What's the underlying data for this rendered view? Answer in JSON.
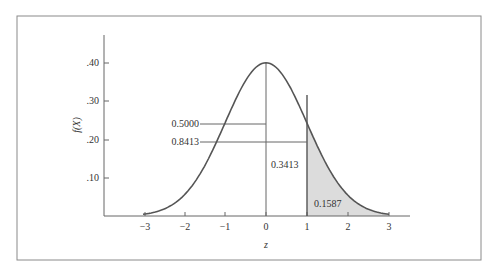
{
  "chart_data": {
    "type": "area",
    "title": "",
    "xlabel": "z",
    "ylabel": "f(X)",
    "x_ticks": [
      "-3",
      "-2",
      "-1",
      "0",
      "1",
      "2",
      "3"
    ],
    "y_ticks": [
      ".10",
      ".20",
      ".30",
      ".40"
    ],
    "xlim": [
      -4,
      3.5
    ],
    "ylim": [
      0,
      0.47
    ],
    "grid": false,
    "series": [
      {
        "name": "Standard normal density",
        "function": "f(z) = exp(-z^2/2)/sqrt(2*pi)",
        "x": [
          -3,
          -2.5,
          -2,
          -1.5,
          -1,
          -0.5,
          0,
          0.5,
          1,
          1.5,
          2,
          2.5,
          3
        ],
        "values": [
          0.0044,
          0.0175,
          0.054,
          0.1295,
          0.242,
          0.3521,
          0.3989,
          0.3521,
          0.242,
          0.1295,
          0.054,
          0.0175,
          0.0044
        ]
      }
    ],
    "shaded_region": {
      "from": 1,
      "to": 3,
      "area": "0.1587"
    },
    "annotations": [
      {
        "text": "0.5000",
        "target": "area left of z=0"
      },
      {
        "text": "0.8413",
        "target": "area left of z=1"
      },
      {
        "text": "0.3413",
        "target": "area between z=0 and z=1"
      },
      {
        "text": "0.1587",
        "target": "area right of z=1 (shaded)"
      }
    ]
  },
  "labels": {
    "ylabel": "f(X)",
    "xlabel": "z",
    "ann_half": "0.5000",
    "ann_8413": "0.8413",
    "ann_3413": "0.3413",
    "ann_1587": "0.1587",
    "xt": [
      "−3",
      "−2",
      "−1",
      "0",
      "1",
      "2",
      "3"
    ],
    "yt": [
      ".10",
      ".20",
      ".30",
      ".40"
    ]
  },
  "colors": {
    "curve": "#555555",
    "shade": "#dcdcdc",
    "axis": "#666666",
    "frame": "#888888"
  }
}
